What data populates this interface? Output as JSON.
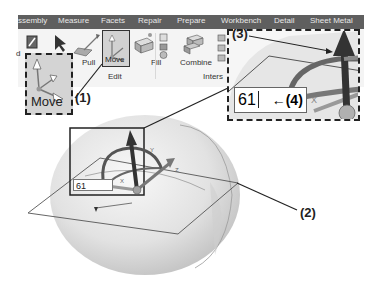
{
  "menubar": {
    "tabs": [
      "ssembly",
      "Measure",
      "Facets",
      "Repair",
      "Prepare",
      "Workbench",
      "Detail",
      "Sheet Metal"
    ]
  },
  "ribbon": {
    "buttons": {
      "pull": "Pull",
      "move": "Move",
      "fill": "Fill",
      "combine": "Combine"
    },
    "groups": {
      "edit": "Edit",
      "intersect": "Inters",
      "left_partial": "d"
    }
  },
  "callouts": {
    "move_label": "Move",
    "label_1": "(1)",
    "label_2": "(2)",
    "label_3": "(3)",
    "label_4": "(4)",
    "arrow_4": "←"
  },
  "viewport": {
    "dimension_input_value": "61",
    "zoom_dimension_value": "61",
    "axis_labels": {
      "x": "X",
      "y": "Y",
      "z": "Z"
    }
  },
  "colors": {
    "menubar_bg": "#5f5f5f",
    "sphere_fill": "#e4e4e4",
    "arrow_dark": "#3a3a3a"
  }
}
